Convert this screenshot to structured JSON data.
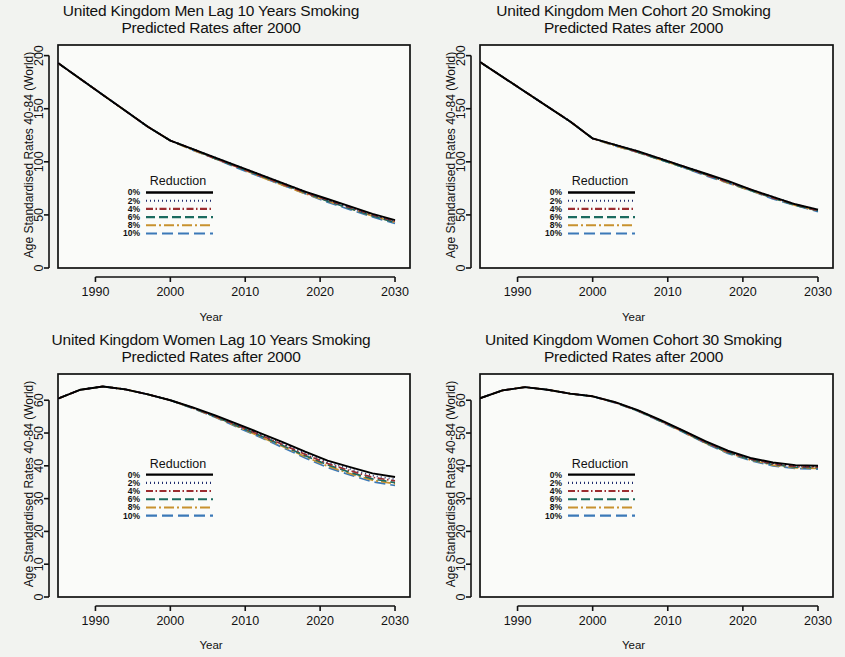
{
  "figure": {
    "background": "#f2f3f0",
    "panel_background": "#fafbf9"
  },
  "legend": {
    "title": "Reduction",
    "entries": [
      {
        "label": "0%",
        "color": "#000000",
        "dash": "none"
      },
      {
        "label": "2%",
        "color": "#1f2d6e",
        "dash": "dotted"
      },
      {
        "label": "4%",
        "color": "#9b2d30",
        "dash": "dashdot"
      },
      {
        "label": "6%",
        "color": "#1b6b5f",
        "dash": "dashed"
      },
      {
        "label": "8%",
        "color": "#c8922f",
        "dash": "longdashdot"
      },
      {
        "label": "10%",
        "color": "#3b79b8",
        "dash": "longdash"
      }
    ]
  },
  "axis_common": {
    "xlabel": "Year",
    "ylabel": "Age Standardised Rates 40-84 (World)",
    "xticks": [
      "1990",
      "2000",
      "2010",
      "2020",
      "2030"
    ],
    "xlim": [
      1985,
      2032
    ]
  },
  "chart_data": [
    {
      "id": "uk-men-lag10",
      "type": "line",
      "title": "United Kingdom Men Lag 10 Years Smoking",
      "subtitle": "Predicted Rates after 2000",
      "xlabel": "Year",
      "ylabel": "Age Standardised Rates 40-84 (World)",
      "xlim": [
        1985,
        2032
      ],
      "ylim": [
        0,
        210
      ],
      "yticks": [
        0,
        50,
        100,
        150,
        200
      ],
      "ytick_labels": [
        "0",
        "50",
        "100",
        "150",
        "200"
      ],
      "xticks": [
        1990,
        2000,
        2010,
        2020,
        2030
      ],
      "xtick_labels": [
        "1990",
        "2000",
        "2010",
        "2020",
        "2030"
      ],
      "grid": false,
      "legend_position": "center-left",
      "x": [
        1985,
        1988,
        1991,
        1994,
        1997,
        2000,
        2003,
        2006,
        2009,
        2012,
        2015,
        2018,
        2021,
        2024,
        2027,
        2030
      ],
      "series": [
        {
          "name": "0%",
          "values": [
            193,
            178,
            163,
            148,
            133,
            120,
            112,
            104,
            96,
            88,
            80,
            72,
            65,
            58,
            51,
            45
          ]
        },
        {
          "name": "2%",
          "values": [
            193,
            178,
            163,
            148,
            133,
            120,
            112,
            104,
            96,
            88,
            80,
            72,
            64,
            57,
            50,
            44
          ]
        },
        {
          "name": "4%",
          "values": [
            193,
            178,
            163,
            148,
            133,
            120,
            112,
            103,
            95,
            87,
            79,
            71,
            64,
            57,
            50,
            44
          ]
        },
        {
          "name": "6%",
          "values": [
            193,
            178,
            163,
            148,
            133,
            120,
            112,
            103,
            95,
            87,
            79,
            71,
            63,
            56,
            49,
            43
          ]
        },
        {
          "name": "8%",
          "values": [
            193,
            178,
            163,
            148,
            133,
            120,
            111,
            103,
            95,
            86,
            78,
            70,
            63,
            56,
            49,
            43
          ]
        },
        {
          "name": "10%",
          "values": [
            193,
            178,
            163,
            148,
            133,
            120,
            111,
            103,
            94,
            86,
            78,
            70,
            62,
            55,
            48,
            42
          ]
        }
      ]
    },
    {
      "id": "uk-men-cohort20",
      "type": "line",
      "title": "United Kingdom Men Cohort 20 Smoking",
      "subtitle": "Predicted Rates after 2000",
      "xlabel": "Year",
      "ylabel": "Age Standardised Rates 40-84 (World)",
      "xlim": [
        1985,
        2032
      ],
      "ylim": [
        0,
        210
      ],
      "yticks": [
        0,
        50,
        100,
        150,
        200
      ],
      "ytick_labels": [
        "0",
        "50",
        "100",
        "150",
        "200"
      ],
      "xticks": [
        1990,
        2000,
        2010,
        2020,
        2030
      ],
      "xtick_labels": [
        "1990",
        "2000",
        "2010",
        "2020",
        "2030"
      ],
      "grid": false,
      "legend_position": "center-left",
      "x": [
        1985,
        1988,
        1991,
        1994,
        1997,
        2000,
        2003,
        2006,
        2009,
        2012,
        2015,
        2018,
        2021,
        2024,
        2027,
        2030
      ],
      "series": [
        {
          "name": "0%",
          "values": [
            194,
            180,
            166,
            152,
            138,
            122,
            116,
            110,
            103,
            96,
            89,
            82,
            74,
            67,
            60,
            55
          ]
        },
        {
          "name": "2%",
          "values": [
            194,
            180,
            166,
            152,
            138,
            122,
            116,
            110,
            103,
            96,
            89,
            81,
            74,
            67,
            60,
            55
          ]
        },
        {
          "name": "4%",
          "values": [
            194,
            180,
            166,
            152,
            138,
            122,
            116,
            109,
            103,
            96,
            88,
            81,
            74,
            66,
            60,
            54
          ]
        },
        {
          "name": "6%",
          "values": [
            194,
            180,
            166,
            152,
            138,
            122,
            116,
            109,
            102,
            95,
            88,
            81,
            73,
            66,
            59,
            54
          ]
        },
        {
          "name": "8%",
          "values": [
            194,
            180,
            166,
            152,
            138,
            122,
            115,
            109,
            102,
            95,
            88,
            80,
            73,
            66,
            59,
            54
          ]
        },
        {
          "name": "10%",
          "values": [
            194,
            180,
            166,
            152,
            138,
            122,
            115,
            109,
            102,
            95,
            87,
            80,
            73,
            65,
            59,
            53
          ]
        }
      ]
    },
    {
      "id": "uk-women-lag10",
      "type": "line",
      "title": "United Kingdom Women Lag 10 Years Smoking",
      "subtitle": "Predicted Rates after 2000",
      "xlabel": "Year",
      "ylabel": "Age Standardised Rates 40-84 (World)",
      "xlim": [
        1985,
        2032
      ],
      "ylim": [
        0,
        68
      ],
      "yticks": [
        0,
        10,
        20,
        30,
        40,
        50,
        60
      ],
      "ytick_labels": [
        "0",
        "10",
        "20",
        "30",
        "40",
        "50",
        "60"
      ],
      "xticks": [
        1990,
        2000,
        2010,
        2020,
        2030
      ],
      "xtick_labels": [
        "1990",
        "2000",
        "2010",
        "2020",
        "2030"
      ],
      "grid": false,
      "legend_position": "center-left",
      "x": [
        1985,
        1988,
        1991,
        1994,
        1997,
        2000,
        2003,
        2006,
        2009,
        2012,
        2015,
        2018,
        2021,
        2024,
        2027,
        2030
      ],
      "series": [
        {
          "name": "0%",
          "values": [
            60.5,
            63.2,
            64.2,
            63.3,
            61.8,
            60.0,
            57.8,
            55.4,
            52.7,
            50.0,
            47.2,
            44.3,
            41.6,
            39.6,
            37.7,
            36.6
          ]
        },
        {
          "name": "2%",
          "values": [
            60.5,
            63.2,
            64.2,
            63.3,
            61.8,
            60.0,
            57.7,
            55.2,
            52.5,
            49.7,
            46.8,
            43.9,
            41.1,
            39.0,
            37.0,
            35.9
          ]
        },
        {
          "name": "4%",
          "values": [
            60.5,
            63.2,
            64.2,
            63.3,
            61.8,
            60.0,
            57.7,
            55.1,
            52.3,
            49.4,
            46.5,
            43.5,
            40.7,
            38.5,
            36.5,
            35.4
          ]
        },
        {
          "name": "6%",
          "values": [
            60.5,
            63.2,
            64.2,
            63.3,
            61.8,
            60.0,
            57.6,
            55.0,
            52.1,
            49.2,
            46.2,
            43.1,
            40.3,
            38.0,
            36.0,
            34.9
          ]
        },
        {
          "name": "8%",
          "values": [
            60.5,
            63.2,
            64.2,
            63.3,
            61.8,
            60.0,
            57.6,
            54.9,
            51.9,
            48.9,
            45.9,
            42.8,
            39.9,
            37.6,
            35.6,
            34.5
          ]
        },
        {
          "name": "10%",
          "values": [
            60.5,
            63.2,
            64.2,
            63.3,
            61.8,
            60.0,
            57.5,
            54.8,
            51.7,
            48.7,
            45.6,
            42.4,
            39.5,
            37.2,
            35.1,
            34.0
          ]
        }
      ]
    },
    {
      "id": "uk-women-cohort30",
      "type": "line",
      "title": "United Kingdom Women Cohort 30 Smoking",
      "subtitle": "Predicted Rates after 2000",
      "xlabel": "Year",
      "ylabel": "Age Standardised Rates 40-84 (World)",
      "xlim": [
        1985,
        2032
      ],
      "ylim": [
        0,
        68
      ],
      "yticks": [
        0,
        10,
        20,
        30,
        40,
        50,
        60
      ],
      "ytick_labels": [
        "0",
        "10",
        "20",
        "30",
        "40",
        "50",
        "60"
      ],
      "xticks": [
        1990,
        2000,
        2010,
        2020,
        2030
      ],
      "xtick_labels": [
        "1990",
        "2000",
        "2010",
        "2020",
        "2030"
      ],
      "grid": false,
      "legend_position": "center-left",
      "x": [
        1985,
        1988,
        1991,
        1994,
        1997,
        2000,
        2003,
        2006,
        2009,
        2012,
        2015,
        2018,
        2021,
        2024,
        2027,
        2030
      ],
      "series": [
        {
          "name": "0%",
          "values": [
            60.6,
            63.0,
            64.0,
            63.2,
            62.0,
            61.2,
            59.4,
            57.0,
            54.0,
            50.8,
            47.5,
            44.6,
            42.4,
            41.0,
            40.2,
            40.0
          ]
        },
        {
          "name": "2%",
          "values": [
            60.6,
            63.0,
            64.0,
            63.2,
            62.0,
            61.2,
            59.4,
            56.9,
            53.9,
            50.7,
            47.4,
            44.4,
            42.2,
            40.8,
            40.0,
            39.8
          ]
        },
        {
          "name": "4%",
          "values": [
            60.6,
            63.0,
            64.0,
            63.2,
            62.0,
            61.2,
            59.3,
            56.9,
            53.8,
            50.6,
            47.2,
            44.3,
            42.1,
            40.6,
            39.8,
            39.6
          ]
        },
        {
          "name": "6%",
          "values": [
            60.6,
            63.0,
            64.0,
            63.2,
            62.0,
            61.2,
            59.3,
            56.8,
            53.7,
            50.5,
            47.1,
            44.1,
            41.9,
            40.4,
            39.6,
            39.4
          ]
        },
        {
          "name": "8%",
          "values": [
            60.6,
            63.0,
            64.0,
            63.2,
            62.0,
            61.2,
            59.3,
            56.8,
            53.7,
            50.4,
            47.0,
            44.0,
            41.8,
            40.2,
            39.4,
            39.2
          ]
        },
        {
          "name": "10%",
          "values": [
            60.6,
            63.0,
            64.0,
            63.2,
            62.0,
            61.2,
            59.2,
            56.7,
            53.6,
            50.3,
            46.9,
            43.8,
            41.6,
            40.0,
            39.2,
            39.0
          ]
        }
      ]
    }
  ]
}
